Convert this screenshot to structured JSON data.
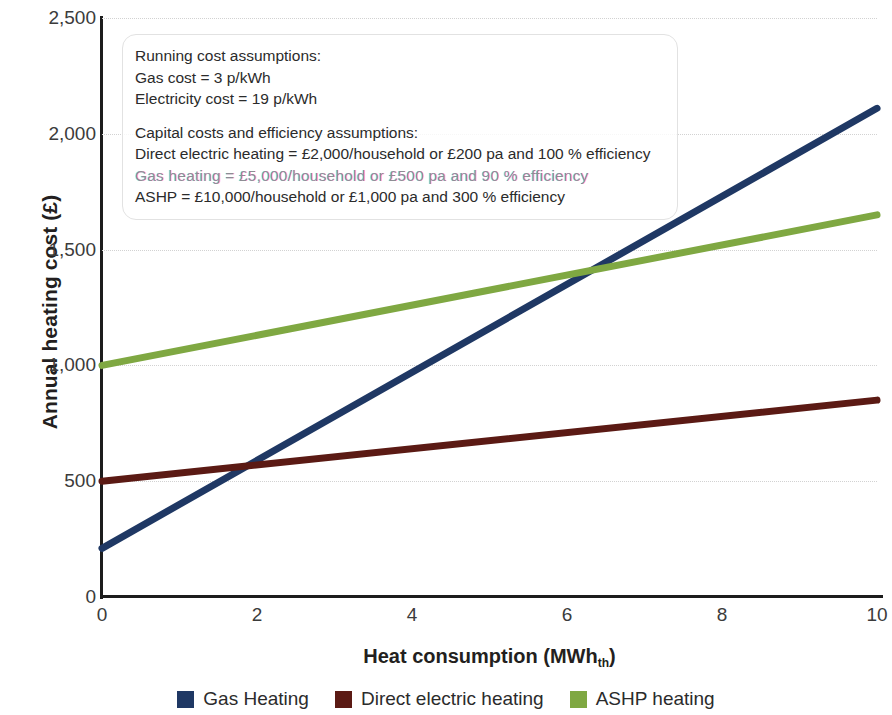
{
  "chart_data": {
    "type": "line",
    "title": "",
    "xlabel": "Heat consumption (MWh",
    "xlabel_sub": "th",
    "xlabel_suffix": ")",
    "ylabel": "Annual heating cost (£)",
    "xlim": [
      0,
      10
    ],
    "ylim": [
      0,
      2500
    ],
    "xticks": [
      "0",
      "2",
      "4",
      "6",
      "8",
      "10"
    ],
    "xtick_values": [
      0,
      2,
      4,
      6,
      8,
      10
    ],
    "yticks": [
      "0",
      "500",
      "1,000",
      "1,500",
      "2,000",
      "2,500"
    ],
    "ytick_values": [
      0,
      500,
      1000,
      1500,
      2000,
      2500
    ],
    "grid": "horizontal-dotted",
    "legend_position": "bottom",
    "x": [
      0,
      10
    ],
    "series": [
      {
        "name": "Gas Heating",
        "color": "#1f3864",
        "values": [
          210,
          2110
        ]
      },
      {
        "name": "Direct electric heating",
        "color": "#5b1a14",
        "values": [
          500,
          850
        ]
      },
      {
        "name": "ASHP heating",
        "color": "#7fa842",
        "values": [
          1000,
          1650
        ]
      }
    ]
  },
  "annotation": {
    "heading_running": "Running cost assumptions:",
    "gas_cost": "Gas cost = 3 p/kWh",
    "electricity_cost": "Electricity cost = 19 p/kWh",
    "heading_capital": "Capital costs and efficiency assumptions:",
    "direct_electric": "Direct electric heating = £2,000/household or £200 pa and 100 % efficiency",
    "gas_heating": "Gas heating = £5,000/household or £500 pa and 90 % efficiency",
    "ashp": "ASHP = £10,000/household or £1,000 pa and 300 % efficiency"
  },
  "legend": {
    "items": [
      {
        "label": "Gas Heating",
        "color": "#1f3864"
      },
      {
        "label": "Direct electric heating",
        "color": "#5b1a14"
      },
      {
        "label": "ASHP heating",
        "color": "#7fa842"
      }
    ]
  }
}
